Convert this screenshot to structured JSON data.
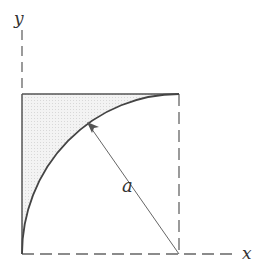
{
  "diagram": {
    "axes": {
      "x_label": "x",
      "y_label": "y"
    },
    "radius_label": "a",
    "colors": {
      "line": "#555555",
      "curve": "#444444",
      "shade": "#ececec",
      "axis_dash": "#666666"
    }
  }
}
